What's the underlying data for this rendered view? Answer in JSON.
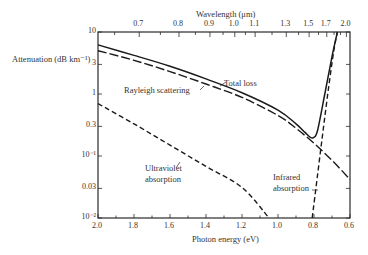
{
  "chart_data": {
    "type": "line",
    "title": "",
    "xlabel": "Photon energy (eV)",
    "x2label": "Wavelength (μm)",
    "ylabel": "Attenuation (dB km⁻¹)",
    "xlim": [
      2.0,
      0.6
    ],
    "ylim": [
      0.01,
      10
    ],
    "yscale": "log",
    "grid": false,
    "legend": "none (inline curve labels)",
    "x_ticks": [
      "2.0",
      "1.8",
      "1.6",
      "1.4",
      "1.2",
      "1.0",
      "0.8",
      "0.6"
    ],
    "x2_ticks": [
      {
        "label": "0.7",
        "energy": 1.771
      },
      {
        "label": "0.8",
        "energy": 1.55
      },
      {
        "label": "0.9",
        "energy": 1.378
      },
      {
        "label": "1.0",
        "energy": 1.24
      },
      {
        "label": "1.1",
        "energy": 1.127
      },
      {
        "label": "1.3",
        "energy": 0.954
      },
      {
        "label": "1.5",
        "energy": 0.827
      },
      {
        "label": "1.7",
        "energy": 0.729
      },
      {
        "label": "2.0",
        "energy": 0.62
      }
    ],
    "y_ticks": [
      {
        "label": "10",
        "value": 10
      },
      {
        "label": "3",
        "value": 3
      },
      {
        "label": "1",
        "value": 1
      },
      {
        "label": "0.3",
        "value": 0.3
      },
      {
        "label": "10⁻¹",
        "value": 0.1
      },
      {
        "label": "0.03",
        "value": 0.03
      },
      {
        "label": "10⁻²",
        "value": 0.01
      }
    ],
    "series": [
      {
        "name": "Total loss",
        "style": "solid",
        "x": [
          2.0,
          1.8,
          1.6,
          1.4,
          1.2,
          1.0,
          0.9,
          0.85,
          0.82,
          0.8,
          0.78,
          0.74,
          0.7,
          0.67
        ],
        "y": [
          6.2,
          4.2,
          2.8,
          1.75,
          1.05,
          0.55,
          0.33,
          0.24,
          0.2,
          0.2,
          0.26,
          1.0,
          4.0,
          10
        ]
      },
      {
        "name": "Rayleigh scattering",
        "style": "long-dash",
        "x": [
          2.0,
          1.8,
          1.6,
          1.4,
          1.2,
          1.0,
          0.9,
          0.8,
          0.7,
          0.6
        ],
        "y": [
          5.0,
          3.5,
          2.3,
          1.45,
          0.88,
          0.45,
          0.28,
          0.16,
          0.085,
          0.042
        ]
      },
      {
        "name": "Ultraviolet absorption",
        "style": "dash",
        "x": [
          2.0,
          1.8,
          1.6,
          1.4,
          1.2,
          1.05
        ],
        "y": [
          0.7,
          0.33,
          0.15,
          0.068,
          0.031,
          0.01
        ]
      },
      {
        "name": "Infrared absorption",
        "style": "dash",
        "x": [
          0.81,
          0.78,
          0.75,
          0.72,
          0.69,
          0.67
        ],
        "y": [
          0.01,
          0.05,
          0.25,
          1.2,
          5.0,
          10
        ]
      }
    ],
    "annotations": [
      "Total loss",
      "Rayleigh scattering",
      "Ultraviolet absorption",
      "Infrared absorption"
    ]
  },
  "labels": {
    "wavelength_axis": "Wavelength (μm)",
    "energy_axis": "Photon energy (eV)",
    "attenuation_axis": "Attenuation (dB km⁻¹)",
    "total_loss": "Total loss",
    "rayleigh": "Rayleigh scattering",
    "uv_line1": "Ultraviolet",
    "uv_line2": "absorption",
    "ir_line1": "Infrared",
    "ir_line2": "absorption"
  }
}
